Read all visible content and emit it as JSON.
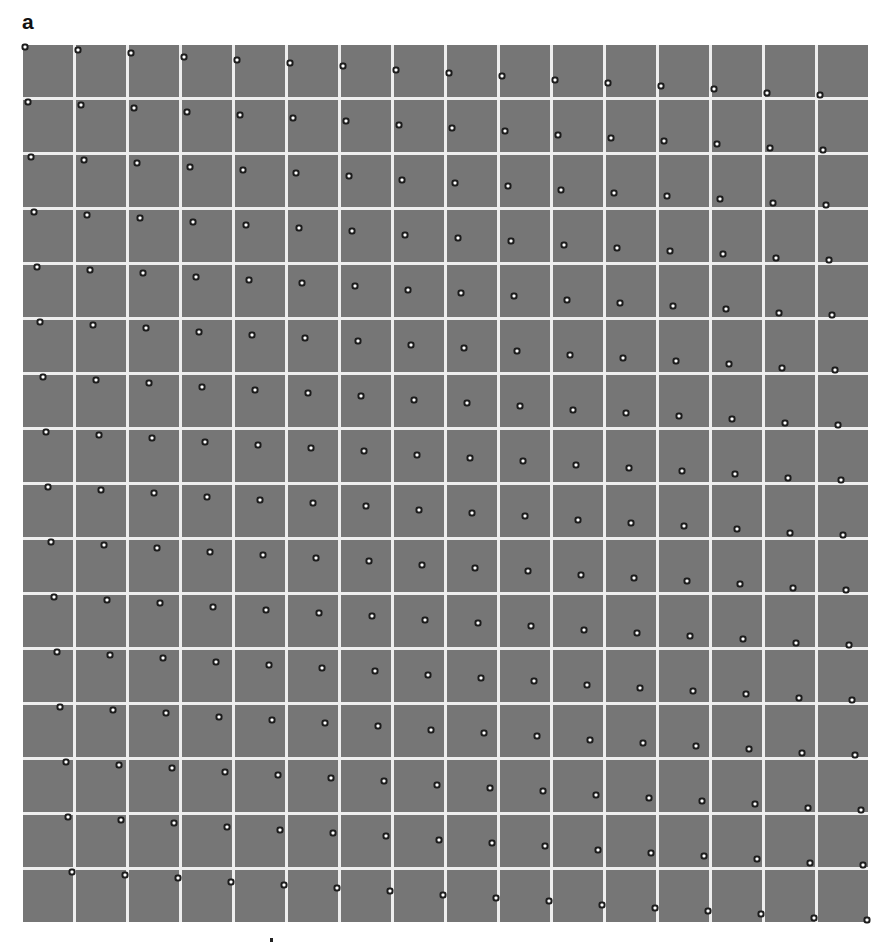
{
  "figure": {
    "panel_label": "a",
    "grid": {
      "rows": 16,
      "cols": 16,
      "tile_color": "#767676",
      "gap_color": "#eeeeee",
      "dot_color": "#ffffff",
      "dot_ring_color": "#1c1c1c"
    },
    "dot_x_fraction_by_row": [
      0.04,
      0.1,
      0.16,
      0.22,
      0.28,
      0.33,
      0.39,
      0.45,
      0.5,
      0.56,
      0.62,
      0.68,
      0.74,
      0.85,
      0.9,
      0.97
    ],
    "dot_y_fraction_by_col": [
      0.03,
      0.1,
      0.16,
      0.23,
      0.29,
      0.35,
      0.41,
      0.48,
      0.54,
      0.6,
      0.67,
      0.73,
      0.79,
      0.85,
      0.92,
      0.97
    ]
  }
}
